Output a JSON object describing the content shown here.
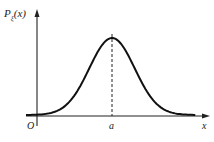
{
  "chart_data": {
    "type": "line",
    "title": "",
    "ylabel": "P_ξ(x)",
    "ylabel_main": "P",
    "ylabel_sub": "ξ",
    "ylabel_paren": "(x)",
    "xlabel": "x",
    "origin_label": "O",
    "xtick_labels": [
      "a"
    ],
    "curve": "normal-density",
    "mean_label": "a",
    "mean_marker": "dashed vertical line at x = a",
    "x_range": [
      -3.6,
      4.2
    ],
    "mean": 0,
    "sigma": 1
  }
}
